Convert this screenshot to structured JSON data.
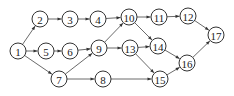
{
  "diagram": {
    "type": "directed-network",
    "node_radius": 8,
    "nodes": [
      {
        "id": "1",
        "label": "1",
        "x": 18,
        "y": 51
      },
      {
        "id": "2",
        "label": "2",
        "x": 40,
        "y": 19
      },
      {
        "id": "3",
        "label": "3",
        "x": 70,
        "y": 19
      },
      {
        "id": "4",
        "label": "4",
        "x": 98,
        "y": 19
      },
      {
        "id": "5",
        "label": "5",
        "x": 46,
        "y": 51
      },
      {
        "id": "6",
        "label": "6",
        "x": 70,
        "y": 51
      },
      {
        "id": "7",
        "label": "7",
        "x": 59,
        "y": 79
      },
      {
        "id": "8",
        "label": "8",
        "x": 103,
        "y": 79
      },
      {
        "id": "9",
        "label": "9",
        "x": 99,
        "y": 48
      },
      {
        "id": "10",
        "label": "10",
        "x": 129,
        "y": 17
      },
      {
        "id": "11",
        "label": "11",
        "x": 159,
        "y": 17
      },
      {
        "id": "12",
        "label": "12",
        "x": 188,
        "y": 16
      },
      {
        "id": "13",
        "label": "13",
        "x": 130,
        "y": 48
      },
      {
        "id": "14",
        "label": "14",
        "x": 158,
        "y": 46
      },
      {
        "id": "15",
        "label": "15",
        "x": 160,
        "y": 79
      },
      {
        "id": "16",
        "label": "16",
        "x": 187,
        "y": 63
      },
      {
        "id": "17",
        "label": "17",
        "x": 216,
        "y": 35
      }
    ],
    "edges": [
      [
        "1",
        "2"
      ],
      [
        "1",
        "5"
      ],
      [
        "1",
        "7"
      ],
      [
        "2",
        "3"
      ],
      [
        "3",
        "4"
      ],
      [
        "4",
        "10"
      ],
      [
        "5",
        "6"
      ],
      [
        "6",
        "9"
      ],
      [
        "7",
        "9"
      ],
      [
        "7",
        "8"
      ],
      [
        "9",
        "10"
      ],
      [
        "9",
        "13"
      ],
      [
        "10",
        "11"
      ],
      [
        "10",
        "14"
      ],
      [
        "11",
        "12"
      ],
      [
        "12",
        "17"
      ],
      [
        "13",
        "14"
      ],
      [
        "13",
        "15"
      ],
      [
        "14",
        "16"
      ],
      [
        "8",
        "15"
      ],
      [
        "15",
        "16"
      ],
      [
        "16",
        "17"
      ]
    ],
    "colors": {
      "stroke": "#333333",
      "fill": "#ffffff",
      "text": "#222222"
    }
  }
}
